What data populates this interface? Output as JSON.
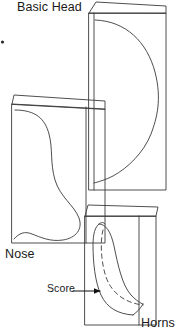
{
  "figure": {
    "type": "papercraft-template-diagram",
    "title_label": "Basic Head",
    "background_color": "#ffffff",
    "line_color": "#1a1a1a",
    "width_px": 183,
    "height_px": 336
  },
  "labels": {
    "basic_head": "Basic Head",
    "nose": "Nose",
    "horns": "Horns",
    "score": "Score"
  },
  "panels": [
    {
      "id": "basic-head",
      "label": "Basic Head",
      "description": "Tall folded card panel with curved head profile cut line",
      "has_fold_flap": true,
      "has_cut_curve": true
    },
    {
      "id": "nose",
      "label": "Nose",
      "description": "Wide folded card panel with rounded nose blob cut line",
      "has_fold_flap": true,
      "has_cut_curve": true
    },
    {
      "id": "horns",
      "label": "Horns",
      "description": "Small folded card panel with curved horn shape and dashed score line",
      "has_fold_flap": true,
      "has_cut_curve": true,
      "has_score_line": true
    }
  ],
  "annotations": [
    {
      "id": "score-callout",
      "text": "Score",
      "points_to": "horn-dashed-fold-line",
      "arrow": "right"
    }
  ]
}
